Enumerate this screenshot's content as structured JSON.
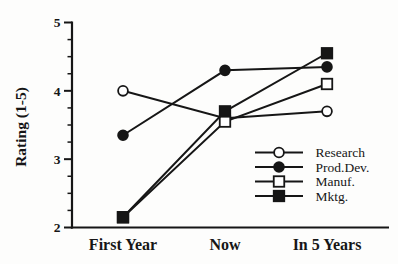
{
  "chart_data": {
    "type": "line",
    "title": "",
    "xlabel": "",
    "ylabel": "Rating (1-5)",
    "categories": [
      "First Year",
      "Now",
      "In 5 Years"
    ],
    "ylim": [
      2,
      5
    ],
    "yticks": [
      2,
      3,
      4,
      5
    ],
    "minor_tick_step": 0.25,
    "grid": false,
    "legend_position": "lower-right",
    "series": [
      {
        "name": "Research",
        "marker": "open-circle",
        "values": [
          4.0,
          3.6,
          3.7
        ]
      },
      {
        "name": "Prod.Dev.",
        "marker": "filled-circle",
        "values": [
          3.35,
          4.3,
          4.35
        ]
      },
      {
        "name": "Manuf.",
        "marker": "open-square",
        "values": [
          2.15,
          3.55,
          4.1
        ]
      },
      {
        "name": "Mktg.",
        "marker": "filled-square",
        "values": [
          2.15,
          3.7,
          4.55
        ]
      }
    ],
    "colors": {
      "ink": "#161616",
      "background": "#fdfdfc",
      "open_marker_fill": "#ffffff"
    }
  }
}
